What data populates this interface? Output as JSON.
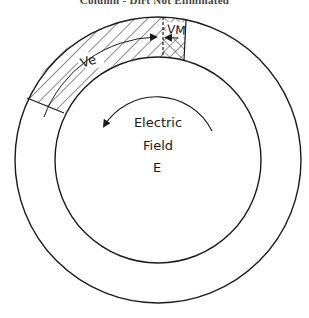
{
  "caption": "Column - Dirt Not Eliminated",
  "labels": {
    "ve": "Ve",
    "vm": "VM",
    "field_line1": "Electric",
    "field_line2": "Field",
    "field_line3": "E"
  },
  "colors": {
    "stroke": "#1a1a1a",
    "background": "#ffffff"
  },
  "icons": {
    "rotation_arrow": "counterclockwise-arc-arrow",
    "boundary_arrows": "opposing-arrowheads"
  }
}
